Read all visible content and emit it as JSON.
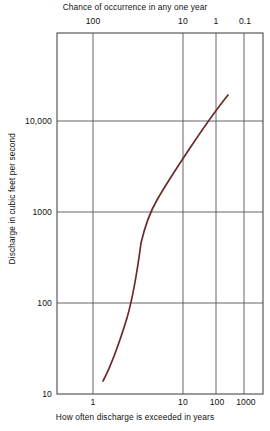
{
  "chart_data": {
    "type": "line",
    "title": "",
    "xlabel": "How often discharge is exceeded in years",
    "ylabel": "Discharge in cubic feet per second",
    "x2label": "Chance of occurrence in any one year",
    "xscale": "probability",
    "yscale": "log",
    "ylim": [
      10,
      100000
    ],
    "grid": true,
    "legend": null,
    "bottom_ticks": [
      {
        "label": "1",
        "x_px": 93
      },
      {
        "label": "10",
        "x_px": 183
      },
      {
        "label": "100",
        "x_px": 216
      },
      {
        "label": "1000",
        "x_px": 244
      }
    ],
    "top_ticks": [
      {
        "label": "100",
        "x_px": 93
      },
      {
        "label": "10",
        "x_px": 183
      },
      {
        "label": "1",
        "x_px": 216
      },
      {
        "label": "0.1",
        "x_px": 244
      }
    ],
    "y_ticks": [
      {
        "label": "10,000",
        "y_px": 121,
        "value": 10000
      },
      {
        "label": "1000",
        "y_px": 212,
        "value": 1000
      },
      {
        "label": "100",
        "y_px": 303,
        "value": 100
      },
      {
        "label": "10",
        "y_px": 394,
        "value": 10
      }
    ],
    "series": [
      {
        "name": "Flood frequency curve",
        "color": "#6b2b22",
        "points": [
          {
            "recurrence_years": 1.03,
            "discharge_cfs": 17
          },
          {
            "recurrence_years": 1.1,
            "discharge_cfs": 33
          },
          {
            "recurrence_years": 1.2,
            "discharge_cfs": 65
          },
          {
            "recurrence_years": 1.4,
            "discharge_cfs": 145
          },
          {
            "recurrence_years": 1.7,
            "discharge_cfs": 310
          },
          {
            "recurrence_years": 2.0,
            "discharge_cfs": 520
          },
          {
            "recurrence_years": 2.5,
            "discharge_cfs": 800
          },
          {
            "recurrence_years": 3.5,
            "discharge_cfs": 1300
          },
          {
            "recurrence_years": 5.0,
            "discharge_cfs": 2000
          },
          {
            "recurrence_years": 10.0,
            "discharge_cfs": 3800
          },
          {
            "recurrence_years": 25.0,
            "discharge_cfs": 6500
          },
          {
            "recurrence_years": 50.0,
            "discharge_cfs": 9500
          },
          {
            "recurrence_years": 100.0,
            "discharge_cfs": 13000
          },
          {
            "recurrence_years": 200.0,
            "discharge_cfs": 17000
          }
        ],
        "pixel_path": "M103,381 C111,366 119,344 127,318 C133,297 138,266 141,243 C145,226 150,212 157,200 C165,186 176,169 190,148 C202,130 216,110 228,95"
      }
    ],
    "colors": {
      "curve": "#6b2b22",
      "frame": "#4a4a4a",
      "grid": "#555555",
      "background": "#ffffff",
      "text": "#111111"
    }
  },
  "plot_area": {
    "left_px": 57,
    "right_px": 263,
    "top_px": 33,
    "bottom_px": 394
  }
}
